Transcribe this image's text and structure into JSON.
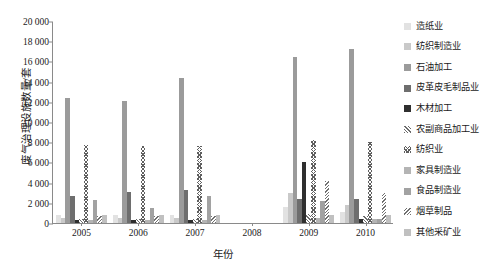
{
  "chart_data": {
    "type": "bar",
    "title": "",
    "xlabel": "年份",
    "ylabel": "废气治理设施数量/套",
    "ylim": [
      0,
      20000
    ],
    "yticks": [
      "0",
      "2 000",
      "4 000",
      "6 000",
      "8 000",
      "10 000",
      "12 000",
      "14 000",
      "16 000",
      "18 000",
      "20 000"
    ],
    "ytick_values": [
      0,
      2000,
      4000,
      6000,
      8000,
      10000,
      12000,
      14000,
      16000,
      18000,
      20000
    ],
    "grid": false,
    "legend_position": "right",
    "categories": [
      "2005",
      "2006",
      "2007",
      "2008",
      "2009",
      "2010"
    ],
    "series": [
      {
        "name": "造纸业",
        "color": "#e2e2e2",
        "fill": "solid",
        "values": [
          800,
          780,
          820,
          0,
          1550,
          1100
        ]
      },
      {
        "name": "纺织制造业",
        "color": "#c9c9c9",
        "fill": "solid",
        "values": [
          480,
          450,
          470,
          0,
          3000,
          1750
        ]
      },
      {
        "name": "石油加工",
        "color": "#9b9b9b",
        "fill": "solid",
        "values": [
          12400,
          12050,
          14400,
          0,
          16450,
          17200
        ]
      },
      {
        "name": "皮革皮毛制品业",
        "color": "#6e6e6e",
        "fill": "solid",
        "values": [
          2650,
          3050,
          3250,
          0,
          2400,
          2350
        ]
      },
      {
        "name": "木材加工",
        "color": "#2f2f2f",
        "fill": "solid",
        "values": [
          330,
          330,
          340,
          0,
          6050,
          350
        ]
      },
      {
        "name": "农副商品加工业",
        "color": "#8e8e8e",
        "fill": "hatch-fine",
        "values": [
          400,
          400,
          420,
          0,
          850,
          700
        ]
      },
      {
        "name": "纺织业",
        "color": "#5f5f5f",
        "fill": "crosshatch",
        "values": [
          7700,
          7650,
          7600,
          0,
          8200,
          8000
        ]
      },
      {
        "name": "家具制造业",
        "color": "#b4b4b4",
        "fill": "solid",
        "values": [
          330,
          330,
          340,
          0,
          500,
          420
        ]
      },
      {
        "name": "食品制造业",
        "color": "#a2a2a2",
        "fill": "solid",
        "values": [
          2250,
          1500,
          2650,
          0,
          2150,
          380
        ]
      },
      {
        "name": "烟草制品",
        "color": "#7c7c7c",
        "fill": "hatch-diag",
        "values": [
          700,
          700,
          720,
          0,
          4150,
          2950
        ]
      },
      {
        "name": "其他采矿业",
        "color": "#c0c0c0",
        "fill": "solid",
        "values": [
          820,
          800,
          830,
          0,
          830,
          820
        ]
      }
    ]
  }
}
